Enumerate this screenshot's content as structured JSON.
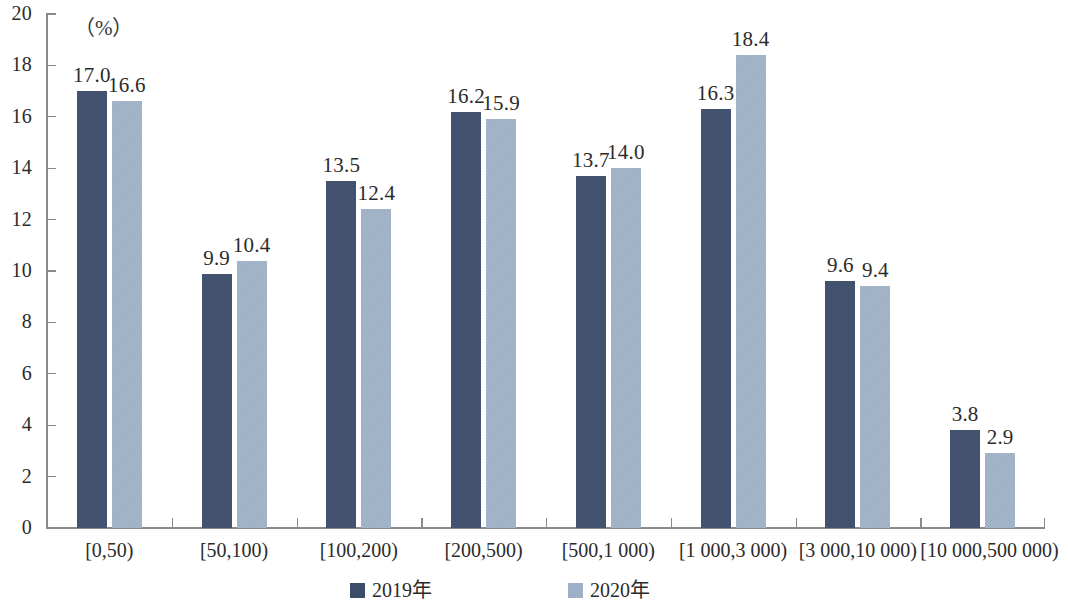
{
  "chart_data": {
    "type": "bar",
    "title": "",
    "subtitle": "",
    "xlabel": "",
    "ylabel": "",
    "unit_label": "（%）",
    "ylim": [
      0,
      20
    ],
    "ytick_step": 2,
    "yticks": [
      "20",
      "18",
      "16",
      "14",
      "12",
      "10",
      "8",
      "6",
      "4",
      "2",
      "0"
    ],
    "grid": false,
    "legend_position": "bottom-center",
    "categories": [
      "[0,50)",
      "[50,100)",
      "[100,200)",
      "[200,500)",
      "[500,1 000)",
      "[1 000,3 000)",
      "[3 000,10 000)",
      "[10 000,500 000)"
    ],
    "series": [
      {
        "name": "2019年",
        "color": "#3c4d6b",
        "values": [
          17.0,
          9.9,
          13.5,
          16.2,
          13.7,
          16.3,
          9.6,
          3.8
        ],
        "labels": [
          "17.0",
          "9.9",
          "13.5",
          "16.2",
          "13.7",
          "16.3",
          "9.6",
          "3.8"
        ]
      },
      {
        "name": "2020年",
        "color": "#9db0c7",
        "values": [
          16.6,
          10.4,
          12.4,
          15.9,
          14.0,
          18.4,
          9.4,
          2.9
        ],
        "labels": [
          "16.6",
          "10.4",
          "12.4",
          "15.9",
          "14.0",
          "18.4",
          "9.4",
          "2.9"
        ]
      }
    ]
  },
  "legend": {
    "items": [
      {
        "label": "2019年",
        "color": "#3c4d6b"
      },
      {
        "label": "2020年",
        "color": "#9db0c7"
      }
    ]
  }
}
